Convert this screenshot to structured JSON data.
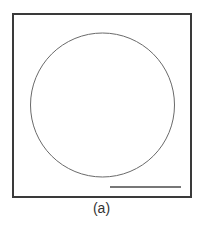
{
  "figure": {
    "label": "(a)",
    "colors": {
      "frame": "#3a3a3a",
      "circle": "#6a6a6a",
      "scale_bar": "#4a4a4a",
      "background": "#ffffff"
    },
    "frame": {
      "x": 13,
      "y": 14,
      "width": 178,
      "height": 183
    },
    "circle": {
      "cx": 102.5,
      "cy": 105,
      "r": 72
    },
    "scale_bar": {
      "x1": 110,
      "y1": 187,
      "x2": 181,
      "y2": 187
    }
  }
}
